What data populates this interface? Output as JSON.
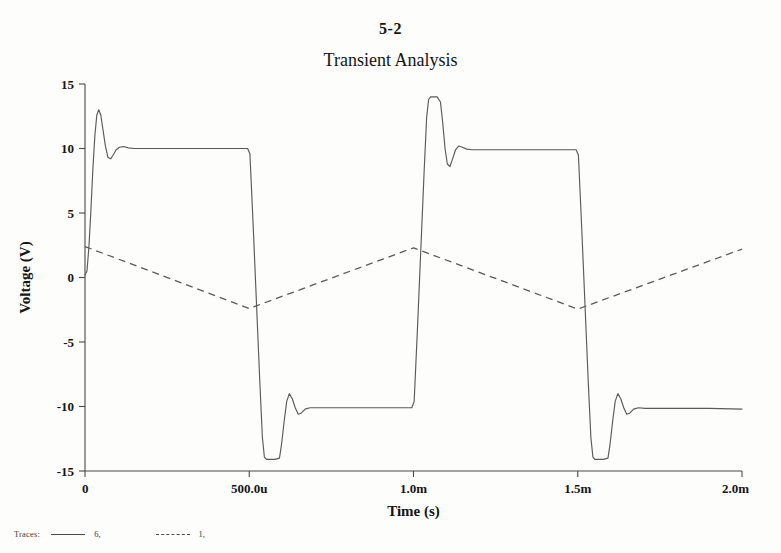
{
  "page": {
    "number": "5-2"
  },
  "chart_data": {
    "type": "line",
    "title": "Transient Analysis",
    "xlabel": "Time (s)",
    "ylabel": "Voltage (V)",
    "xlim": [
      0,
      0.002
    ],
    "ylim": [
      -15,
      15
    ],
    "grid": false,
    "legend_position": "bottom-left",
    "legend_caption": "Traces:",
    "xticks": [
      {
        "value": 0,
        "label": "0"
      },
      {
        "value": 0.0005,
        "label": "500.0u"
      },
      {
        "value": 0.001,
        "label": "1.0m"
      },
      {
        "value": 0.0015,
        "label": "1.5m"
      },
      {
        "value": 0.002,
        "label": "2.0m"
      }
    ],
    "yticks": [
      {
        "value": 15,
        "label": "15"
      },
      {
        "value": 10,
        "label": "10"
      },
      {
        "value": 5,
        "label": "5"
      },
      {
        "value": 0,
        "label": "0"
      },
      {
        "value": -5,
        "label": "-5"
      },
      {
        "value": -10,
        "label": "-10"
      },
      {
        "value": -15,
        "label": "-15"
      }
    ],
    "series": [
      {
        "name": "6,",
        "style": "solid",
        "color": "#5a5a5a",
        "points": [
          [
            0.0,
            0.2
          ],
          [
            6e-06,
            0.5
          ],
          [
            1.2e-05,
            2.4
          ],
          [
            1.8e-05,
            5.2
          ],
          [
            2.4e-05,
            8.4
          ],
          [
            3e-05,
            11.0
          ],
          [
            3.6e-05,
            12.6
          ],
          [
            4.2e-05,
            13.0
          ],
          [
            4.8e-05,
            12.6
          ],
          [
            5.5e-05,
            11.4
          ],
          [
            6.2e-05,
            10.2
          ],
          [
            7e-05,
            9.3
          ],
          [
            7.8e-05,
            9.2
          ],
          [
            8.6e-05,
            9.5
          ],
          [
            9.5e-05,
            9.9
          ],
          [
            0.000105,
            10.1
          ],
          [
            0.000118,
            10.15
          ],
          [
            0.000132,
            10.05
          ],
          [
            0.00015,
            10.0
          ],
          [
            0.00025,
            10.0
          ],
          [
            0.00035,
            10.0
          ],
          [
            0.00045,
            10.0
          ],
          [
            0.000495,
            10.0
          ],
          [
            0.000502,
            9.6
          ],
          [
            0.000512,
            4.0
          ],
          [
            0.000522,
            -2.0
          ],
          [
            0.000532,
            -8.0
          ],
          [
            0.00054,
            -12.4
          ],
          [
            0.000546,
            -13.9
          ],
          [
            0.000552,
            -14.1
          ],
          [
            0.000578,
            -14.1
          ],
          [
            0.000592,
            -14.0
          ],
          [
            0.000598,
            -13.0
          ],
          [
            0.000606,
            -11.2
          ],
          [
            0.000614,
            -9.6
          ],
          [
            0.000622,
            -9.0
          ],
          [
            0.000631,
            -9.4
          ],
          [
            0.00064,
            -10.1
          ],
          [
            0.000649,
            -10.6
          ],
          [
            0.000659,
            -10.5
          ],
          [
            0.00067,
            -10.2
          ],
          [
            0.000685,
            -10.1
          ],
          [
            0.000705,
            -10.1
          ],
          [
            0.00078,
            -10.1
          ],
          [
            0.0009,
            -10.1
          ],
          [
            0.000995,
            -10.1
          ],
          [
            0.001002,
            -9.6
          ],
          [
            0.001012,
            -4.0
          ],
          [
            0.001022,
            2.0
          ],
          [
            0.001032,
            8.0
          ],
          [
            0.00104,
            12.4
          ],
          [
            0.001046,
            13.8
          ],
          [
            0.001052,
            14.0
          ],
          [
            0.001072,
            14.0
          ],
          [
            0.001082,
            13.6
          ],
          [
            0.001089,
            12.0
          ],
          [
            0.001096,
            10.0
          ],
          [
            0.001103,
            8.8
          ],
          [
            0.001111,
            8.6
          ],
          [
            0.001119,
            9.2
          ],
          [
            0.001128,
            9.9
          ],
          [
            0.001138,
            10.2
          ],
          [
            0.001149,
            10.1
          ],
          [
            0.001162,
            9.95
          ],
          [
            0.001178,
            9.9
          ],
          [
            0.0012,
            9.9
          ],
          [
            0.0013,
            9.9
          ],
          [
            0.0014,
            9.9
          ],
          [
            0.001495,
            9.9
          ],
          [
            0.001502,
            9.5
          ],
          [
            0.001512,
            3.9
          ],
          [
            0.001522,
            -2.1
          ],
          [
            0.001532,
            -8.1
          ],
          [
            0.00154,
            -12.4
          ],
          [
            0.001546,
            -13.9
          ],
          [
            0.001552,
            -14.1
          ],
          [
            0.001578,
            -14.1
          ],
          [
            0.001592,
            -14.0
          ],
          [
            0.001598,
            -13.0
          ],
          [
            0.001606,
            -11.2
          ],
          [
            0.001614,
            -9.6
          ],
          [
            0.001622,
            -9.0
          ],
          [
            0.001631,
            -9.4
          ],
          [
            0.00164,
            -10.1
          ],
          [
            0.001649,
            -10.6
          ],
          [
            0.001659,
            -10.5
          ],
          [
            0.00167,
            -10.2
          ],
          [
            0.001685,
            -10.1
          ],
          [
            0.001705,
            -10.15
          ],
          [
            0.00178,
            -10.15
          ],
          [
            0.0019,
            -10.15
          ],
          [
            0.002,
            -10.2
          ]
        ]
      },
      {
        "name": "1,",
        "style": "dashed",
        "color": "#5a5a5a",
        "points": [
          [
            0.0,
            2.4
          ],
          [
            0.0005,
            -2.4
          ],
          [
            0.001,
            2.3
          ],
          [
            0.0015,
            -2.45
          ],
          [
            0.002,
            2.2
          ]
        ]
      }
    ]
  }
}
